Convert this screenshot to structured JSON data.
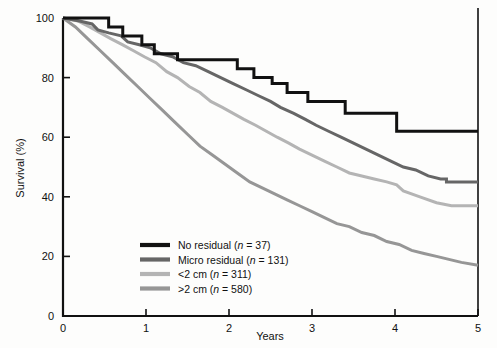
{
  "chart_data": {
    "type": "line",
    "title": "",
    "subtitle": "",
    "xlabel": "Years",
    "ylabel": "Survival (%)",
    "xlim": [
      0,
      5
    ],
    "ylim": [
      0,
      100
    ],
    "xticks": [
      "0",
      "1",
      "2",
      "3",
      "4",
      "5"
    ],
    "xtick_values": [
      0,
      1,
      2,
      3,
      4,
      5
    ],
    "yticks": [
      "0",
      "20",
      "40",
      "60",
      "80",
      "100"
    ],
    "ytick_values": [
      0,
      20,
      40,
      60,
      80,
      100
    ],
    "grid": false,
    "legend_position": "lower-left-inside",
    "step_style": "kaplan-meier",
    "series": [
      {
        "name": "No residual",
        "n": 37,
        "legend_text": "No residual (n = 37)",
        "color": "#111111",
        "line_width": 3.0,
        "final_value": 62,
        "points": [
          [
            0.0,
            100
          ],
          [
            0.55,
            100
          ],
          [
            0.55,
            97
          ],
          [
            0.72,
            97
          ],
          [
            0.72,
            94
          ],
          [
            0.95,
            94
          ],
          [
            0.95,
            91
          ],
          [
            1.1,
            91
          ],
          [
            1.1,
            88
          ],
          [
            1.38,
            88
          ],
          [
            1.38,
            86
          ],
          [
            2.1,
            86
          ],
          [
            2.1,
            83
          ],
          [
            2.3,
            83
          ],
          [
            2.3,
            80
          ],
          [
            2.52,
            80
          ],
          [
            2.52,
            78
          ],
          [
            2.7,
            78
          ],
          [
            2.7,
            75
          ],
          [
            2.95,
            75
          ],
          [
            2.95,
            72
          ],
          [
            3.4,
            72
          ],
          [
            3.4,
            68
          ],
          [
            4.02,
            68
          ],
          [
            4.02,
            62
          ],
          [
            5.0,
            62
          ]
        ]
      },
      {
        "name": "Micro residual",
        "n": 131,
        "legend_text": "Micro residual (n = 131)",
        "color": "#666666",
        "line_width": 3.0,
        "final_value": 45,
        "points": [
          [
            0.0,
            100
          ],
          [
            0.2,
            99
          ],
          [
            0.35,
            98
          ],
          [
            0.42,
            96
          ],
          [
            0.55,
            95
          ],
          [
            0.7,
            94
          ],
          [
            0.78,
            92
          ],
          [
            0.92,
            91
          ],
          [
            1.05,
            90
          ],
          [
            1.18,
            88
          ],
          [
            1.32,
            87
          ],
          [
            1.45,
            85
          ],
          [
            1.6,
            84
          ],
          [
            1.75,
            82
          ],
          [
            1.9,
            80
          ],
          [
            2.05,
            78
          ],
          [
            2.2,
            76
          ],
          [
            2.35,
            74
          ],
          [
            2.5,
            72
          ],
          [
            2.62,
            70
          ],
          [
            2.78,
            68
          ],
          [
            2.92,
            66
          ],
          [
            3.05,
            64
          ],
          [
            3.2,
            62
          ],
          [
            3.35,
            60
          ],
          [
            3.5,
            58
          ],
          [
            3.65,
            56
          ],
          [
            3.8,
            54
          ],
          [
            3.95,
            52
          ],
          [
            4.1,
            50
          ],
          [
            4.25,
            49
          ],
          [
            4.4,
            47
          ],
          [
            4.55,
            46
          ],
          [
            4.62,
            46
          ],
          [
            4.62,
            45
          ],
          [
            5.0,
            45
          ]
        ]
      },
      {
        "name": "<2 cm",
        "n": 311,
        "legend_text": "<2 cm (n = 311)",
        "color": "#b4b4b4",
        "line_width": 3.0,
        "final_value": 37,
        "points": [
          [
            0.0,
            100
          ],
          [
            0.18,
            99
          ],
          [
            0.32,
            97
          ],
          [
            0.45,
            95
          ],
          [
            0.58,
            93
          ],
          [
            0.72,
            91
          ],
          [
            0.85,
            89
          ],
          [
            0.98,
            87
          ],
          [
            1.12,
            85
          ],
          [
            1.25,
            82
          ],
          [
            1.38,
            80
          ],
          [
            1.52,
            77
          ],
          [
            1.65,
            75
          ],
          [
            1.78,
            72
          ],
          [
            1.92,
            70
          ],
          [
            2.05,
            68
          ],
          [
            2.18,
            66
          ],
          [
            2.32,
            64
          ],
          [
            2.45,
            62
          ],
          [
            2.58,
            60
          ],
          [
            2.72,
            58
          ],
          [
            2.85,
            56
          ],
          [
            3.0,
            54
          ],
          [
            3.15,
            52
          ],
          [
            3.3,
            50
          ],
          [
            3.45,
            48
          ],
          [
            3.6,
            47
          ],
          [
            3.75,
            46
          ],
          [
            3.9,
            45
          ],
          [
            4.02,
            44
          ],
          [
            4.1,
            42
          ],
          [
            4.3,
            40
          ],
          [
            4.5,
            38
          ],
          [
            4.68,
            37
          ],
          [
            5.0,
            37
          ]
        ]
      },
      {
        "name": ">2 cm",
        "n": 580,
        "legend_text": ">2 cm (n = 580)",
        "color": "#969696",
        "line_width": 3.0,
        "final_value": 17,
        "points": [
          [
            0.0,
            100
          ],
          [
            0.15,
            97
          ],
          [
            0.3,
            93
          ],
          [
            0.45,
            89
          ],
          [
            0.6,
            85
          ],
          [
            0.75,
            81
          ],
          [
            0.9,
            77
          ],
          [
            1.05,
            73
          ],
          [
            1.2,
            69
          ],
          [
            1.35,
            65
          ],
          [
            1.5,
            61
          ],
          [
            1.65,
            57
          ],
          [
            1.8,
            54
          ],
          [
            1.95,
            51
          ],
          [
            2.1,
            48
          ],
          [
            2.25,
            45
          ],
          [
            2.4,
            43
          ],
          [
            2.55,
            41
          ],
          [
            2.7,
            39
          ],
          [
            2.85,
            37
          ],
          [
            3.0,
            35
          ],
          [
            3.15,
            33
          ],
          [
            3.3,
            31
          ],
          [
            3.45,
            30
          ],
          [
            3.6,
            28
          ],
          [
            3.75,
            27
          ],
          [
            3.9,
            25
          ],
          [
            4.05,
            24
          ],
          [
            4.2,
            22
          ],
          [
            4.35,
            21
          ],
          [
            4.5,
            20
          ],
          [
            4.65,
            19
          ],
          [
            4.8,
            18
          ],
          [
            5.0,
            17
          ]
        ]
      }
    ]
  },
  "legend": {
    "items": [
      {
        "label": "No residual (n = 37)",
        "name_part": "No residual (",
        "n_part": "n",
        "value_part": " = 37)",
        "color": "#111111"
      },
      {
        "label": "Micro residual (n = 131)",
        "name_part": "Micro residual (",
        "n_part": "n",
        "value_part": " = 131)",
        "color": "#666666"
      },
      {
        "label": "<2 cm (n = 311)",
        "name_part": "<2 cm (",
        "n_part": "n",
        "value_part": " = 311)",
        "color": "#b4b4b4"
      },
      {
        "label": ">2 cm (n = 580)",
        "name_part": ">2 cm (",
        "n_part": "n",
        "value_part": " = 580)",
        "color": "#969696"
      }
    ]
  },
  "axes": {
    "x_title": "Years",
    "y_title": "Survival (%)",
    "x_tick_labels": [
      "0",
      "1",
      "2",
      "3",
      "4",
      "5"
    ],
    "y_tick_labels": [
      "0",
      "20",
      "40",
      "60",
      "80",
      "100"
    ],
    "axis_color": "#111111"
  }
}
